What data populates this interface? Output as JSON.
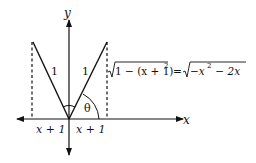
{
  "diagram": {
    "axes": {
      "x_label": "x",
      "y_label": "y"
    },
    "segments": {
      "left_label": "1",
      "right_label": "1"
    },
    "angle_label": "θ",
    "base_labels": {
      "left": "x + 1",
      "right": "x + 1"
    },
    "equation": {
      "lhs_radicand": "1 − (x + 1)",
      "lhs_exp": "2",
      "equals": "=",
      "rhs_radicand_a": "−x",
      "rhs_exp": "2",
      "rhs_radicand_b": " − 2x"
    },
    "colors": {
      "stroke": "#111111",
      "background": "#ffffff"
    }
  }
}
